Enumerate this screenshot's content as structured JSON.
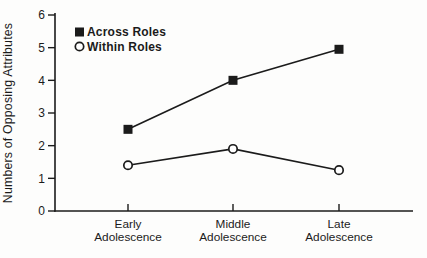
{
  "figure": {
    "background": "#fdfdfc",
    "ink_color": "#1b1b1b",
    "marker_fill_open": "#ffffff"
  },
  "chart_data": {
    "type": "line",
    "title": "",
    "xlabel": "",
    "ylabel": "Numbers of Opposing Attributes",
    "categories": [
      [
        "Early",
        "Adolescence"
      ],
      [
        "Middle",
        "Adolescence"
      ],
      [
        "Late",
        "Adolescence"
      ]
    ],
    "ylim": [
      0,
      6
    ],
    "yticks": [
      0,
      1,
      2,
      3,
      4,
      5,
      6
    ],
    "grid": false,
    "legend_position": "top-left-inside",
    "series": [
      {
        "name": "Across Roles",
        "marker": "filled-square",
        "color": "#1b1b1b",
        "values": [
          2.5,
          4.0,
          4.95
        ]
      },
      {
        "name": "Within Roles",
        "marker": "open-circle",
        "color": "#1b1b1b",
        "values": [
          1.4,
          1.9,
          1.25
        ]
      }
    ]
  }
}
